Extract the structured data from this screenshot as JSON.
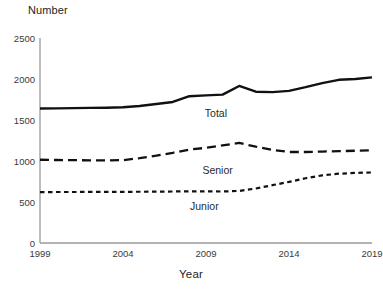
{
  "chart_data": {
    "type": "line",
    "title": "",
    "xlabel": "Year",
    "ylabel": "Number",
    "xlim": [
      1999,
      2019
    ],
    "ylim": [
      0,
      2500
    ],
    "grid": false,
    "legend_position": "inline-annotations",
    "xticks": [
      "1999",
      "2004",
      "2009",
      "2014",
      "2019"
    ],
    "yticks": [
      "0",
      "500",
      "1000",
      "1500",
      "2000",
      "2500"
    ],
    "x": [
      1999,
      2000,
      2001,
      2002,
      2003,
      2004,
      2005,
      2006,
      2007,
      2008,
      2009,
      2010,
      2011,
      2012,
      2013,
      2014,
      2015,
      2016,
      2017,
      2018,
      2019
    ],
    "series": [
      {
        "name": "Total",
        "style": "solid",
        "color": "#111111",
        "values": [
          1640,
          1642,
          1645,
          1648,
          1650,
          1655,
          1670,
          1695,
          1720,
          1790,
          1800,
          1810,
          1915,
          1845,
          1840,
          1855,
          1900,
          1950,
          1990,
          2000,
          2020
        ],
        "label_x": 2009.6,
        "label_y": 1585
      },
      {
        "name": "Senior",
        "style": "dashed",
        "color": "#111111",
        "values": [
          1015,
          1012,
          1010,
          1008,
          1008,
          1010,
          1035,
          1065,
          1100,
          1140,
          1160,
          1190,
          1220,
          1175,
          1135,
          1110,
          1110,
          1115,
          1120,
          1125,
          1130
        ],
        "label_x": 2009.7,
        "label_y": 885
      },
      {
        "name": "Junior",
        "style": "dotted",
        "color": "#111111",
        "values": [
          620,
          622,
          622,
          623,
          623,
          624,
          625,
          626,
          628,
          630,
          630,
          628,
          635,
          665,
          705,
          745,
          790,
          825,
          845,
          855,
          860
        ],
        "label_x": 2008.9,
        "label_y": 450
      }
    ]
  },
  "axis": {
    "y_title": "Number",
    "x_title": "Year"
  }
}
